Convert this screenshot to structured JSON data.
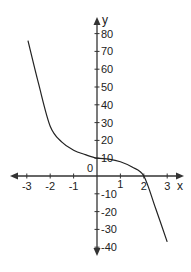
{
  "chart_data": {
    "type": "line",
    "title": "",
    "xlabel": "x",
    "ylabel": "y",
    "xlim": [
      -3.3,
      3.4
    ],
    "ylim": [
      -42,
      84
    ],
    "grid": false,
    "legend": null,
    "x_ticks": [
      -3,
      -2,
      -1,
      1,
      2,
      3
    ],
    "x_tick_labels": [
      "-3",
      "-2",
      "-1",
      "1",
      "2",
      "3"
    ],
    "y_ticks": [
      80,
      70,
      60,
      50,
      40,
      30,
      20,
      10,
      -10,
      -20,
      -30,
      -40
    ],
    "y_tick_labels": [
      "80",
      "70",
      "60",
      "50",
      "40",
      "30",
      "20",
      "10",
      "-10",
      "-20",
      "-30",
      "-40"
    ],
    "origin_label": "0",
    "series": [
      {
        "name": "f(x)",
        "color": "#222222",
        "x": [
          -2.95,
          -2.5,
          -2.0,
          -1.5,
          -1.0,
          -0.5,
          0.0,
          0.5,
          1.0,
          1.5,
          2.0,
          2.5,
          3.0
        ],
        "y": [
          76,
          52,
          28,
          19,
          14.5,
          12,
          10,
          9.5,
          8,
          5,
          0,
          -18,
          -37
        ]
      }
    ],
    "annotations": []
  },
  "axis": {
    "x_title": "x",
    "y_title": "y",
    "origin": "0"
  }
}
